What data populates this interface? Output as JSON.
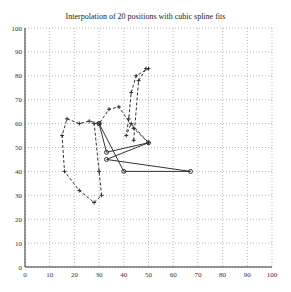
{
  "chart_data": {
    "type": "line",
    "title": "Interpolation of 20 positions with cubic spline fits",
    "xlabel": "",
    "ylabel": "",
    "xlim": [
      0,
      100
    ],
    "ylim": [
      0,
      100
    ],
    "xticks": [
      0,
      10,
      20,
      30,
      40,
      50,
      60,
      70,
      80,
      90,
      100
    ],
    "yticks": [
      0,
      10,
      20,
      30,
      40,
      50,
      60,
      70,
      80,
      90,
      100
    ],
    "grid": true,
    "series": [
      {
        "name": "spline fit (dashed, + markers)",
        "style": "dashed",
        "x": [
          44,
          46,
          49,
          50,
          45,
          43,
          42,
          41,
          43,
          50,
          44,
          38,
          34,
          30,
          26,
          22,
          17,
          15,
          16,
          22,
          28,
          31,
          30,
          28
        ],
        "y": [
          53,
          78,
          83,
          83,
          80,
          73,
          62,
          55,
          60,
          52,
          58,
          67,
          66,
          60,
          61,
          60,
          62,
          55,
          40,
          32,
          27,
          30,
          40,
          60
        ]
      },
      {
        "name": "positions (solid, o markers)",
        "style": "solid",
        "x": [
          30,
          40,
          67,
          33,
          50,
          33,
          30
        ],
        "y": [
          60,
          40,
          40,
          45,
          52,
          48,
          60
        ]
      }
    ]
  }
}
